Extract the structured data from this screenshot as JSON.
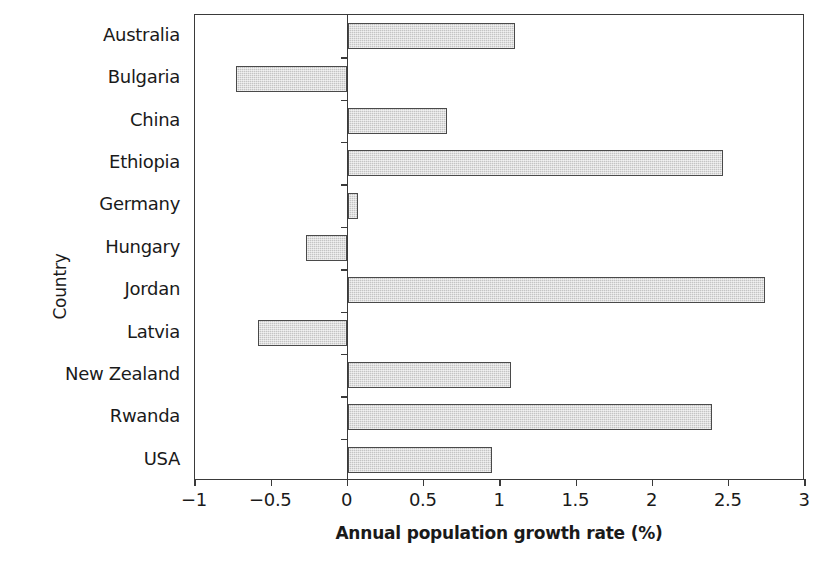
{
  "chart_data": {
    "type": "bar",
    "orientation": "horizontal",
    "title": "",
    "xlabel": "Annual population growth rate (%)",
    "ylabel": "Country",
    "categories": [
      "Australia",
      "Bulgaria",
      "China",
      "Ethiopia",
      "Germany",
      "Hungary",
      "Jordan",
      "Latvia",
      "New Zealand",
      "Rwanda",
      "USA"
    ],
    "values": [
      1.1,
      -0.73,
      0.65,
      2.46,
      0.07,
      -0.27,
      2.74,
      -0.59,
      1.07,
      2.39,
      0.95
    ],
    "series": [
      {
        "name": "Annual population growth rate (%)",
        "values": [
          1.1,
          -0.73,
          0.65,
          2.46,
          0.07,
          -0.27,
          2.74,
          -0.59,
          1.07,
          2.39,
          0.95
        ]
      }
    ],
    "xlim": [
      -1,
      3
    ],
    "xticks": [
      -1,
      -0.5,
      0,
      0.5,
      1,
      1.5,
      2,
      2.5,
      3
    ],
    "xtick_labels": [
      "−1",
      "−0.5",
      "0",
      "0.5",
      "1",
      "1.5",
      "2",
      "2.5",
      "3"
    ],
    "grid": false,
    "legend": false,
    "bar_fill_color": "#c4c4c4",
    "bar_edge_color": "#4a4a4a",
    "axis_color": "#3a3a3a",
    "background_color": "#ffffff"
  }
}
